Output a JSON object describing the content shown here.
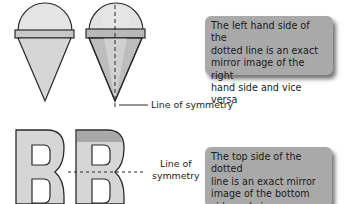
{
  "top_section": {
    "callout_text": "The left hand side of the\ndotted line is an exact\nmirror image of the right\nhand side and vice versa",
    "label": "Line of symmetry"
  },
  "bottom_section": {
    "callout_text": "The top side of the dotted\nline is an exact mirror\nimage of the bottom\nside and vice versa",
    "label": "Line of\nsymmetry"
  },
  "colors": {
    "shape_fill": "#d6d6d6",
    "shape_dark": "#b3b3b3",
    "shape_top": "#e4e4e4",
    "outline": "#2a2a2a",
    "callout_bg": "#a9a9a9"
  }
}
